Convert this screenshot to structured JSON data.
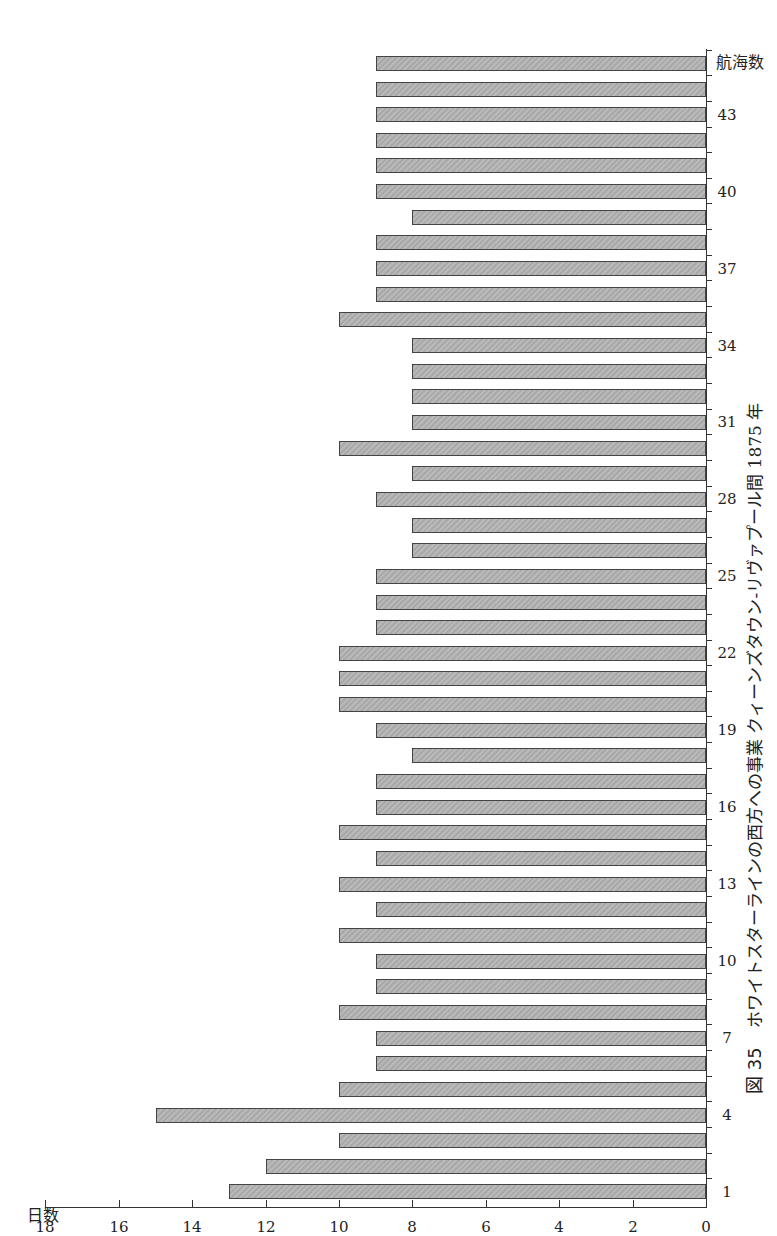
{
  "chart_data": {
    "type": "bar",
    "orientation": "rotated 90deg (book page scan)",
    "figure_number": "図 35",
    "caption": "ホワイトスターラインの西方への事業 クィーンズタウン-リヴァプール間 1875 年",
    "xlabel": "航海数",
    "ylabel": "日数",
    "ylim": [
      0,
      18
    ],
    "yticks": [
      0,
      2,
      4,
      6,
      8,
      10,
      12,
      14,
      16,
      18
    ],
    "xtick_labels": [
      1,
      4,
      7,
      10,
      13,
      16,
      19,
      22,
      25,
      28,
      31,
      34,
      37,
      40,
      43
    ],
    "grid": false,
    "legend": null,
    "categories": [
      1,
      2,
      3,
      4,
      5,
      6,
      7,
      8,
      9,
      10,
      11,
      12,
      13,
      14,
      15,
      16,
      17,
      18,
      19,
      20,
      21,
      22,
      23,
      24,
      25,
      26,
      27,
      28,
      29,
      30,
      31,
      32,
      33,
      34,
      35,
      36,
      37,
      38,
      39,
      40,
      41,
      42,
      43,
      44,
      45
    ],
    "values": [
      13,
      12,
      10,
      15,
      10,
      9,
      9,
      10,
      9,
      9,
      10,
      9,
      10,
      9,
      10,
      9,
      9,
      8,
      9,
      10,
      10,
      10,
      9,
      9,
      9,
      8,
      8,
      9,
      8,
      10,
      8,
      8,
      8,
      8,
      10,
      9,
      9,
      9,
      8,
      9,
      9,
      9,
      9,
      9,
      9
    ]
  }
}
